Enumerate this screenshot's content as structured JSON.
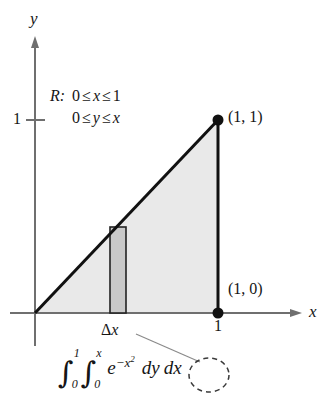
{
  "figure": {
    "axes": {
      "y_axis_name": "y",
      "x_axis_name": "x",
      "y_tick_label": "1",
      "x_tick_label": "1"
    },
    "region": {
      "name": "R:",
      "condition_x": "0 ≤ x ≤ 1",
      "condition_y": "0 ≤ y ≤ x",
      "cond_x_left": "0",
      "cond_x_rel1": "≤",
      "cond_x_var": "x",
      "cond_x_rel2": "≤",
      "cond_x_right": "1",
      "cond_y_left": "0",
      "cond_y_rel1": "≤",
      "cond_y_var": "y",
      "cond_y_rel2": "≤",
      "cond_y_right": "x"
    },
    "points": [
      {
        "label": "(1, 1)",
        "x": 1,
        "y": 1
      },
      {
        "label": "(1, 0)",
        "x": 1,
        "y": 0
      }
    ],
    "strip": {
      "label": "Δx",
      "delta_symbol": "Δ",
      "variable": "x"
    },
    "integral": {
      "outer_symbol": "∫",
      "outer_upper": "1",
      "outer_lower": "0",
      "inner_symbol": "∫",
      "inner_upper": "x",
      "inner_lower": "0",
      "integrand_base": "e",
      "integrand_exponent": "−x",
      "integrand_exponent_power": "2",
      "inner_differential": "dy",
      "outer_differential": "dx",
      "circled_term": "dx"
    },
    "colors": {
      "region_fill": "#e9e9e9",
      "strip_fill": "#c9c9c9",
      "outline": "#111111",
      "axis": "#6f6f6f",
      "leader": "#8a8a8a"
    }
  }
}
